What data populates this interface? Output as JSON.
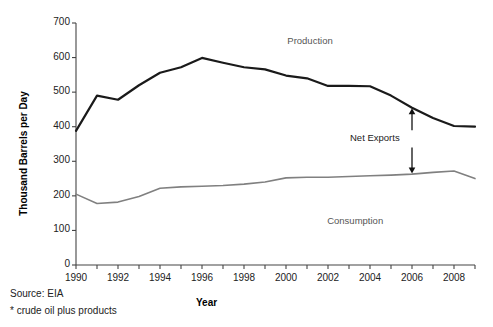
{
  "chart_data": {
    "type": "line",
    "title": "",
    "xlabel": "Year",
    "ylabel": "Thousand Barrels per Day",
    "xlim": [
      1990,
      2009
    ],
    "ylim": [
      0,
      700
    ],
    "ytick_values": [
      0,
      100,
      200,
      300,
      400,
      500,
      600,
      700
    ],
    "ytick_labels": [
      "0",
      "100",
      "200",
      "300",
      "400",
      "500",
      "600",
      "700"
    ],
    "xtick_values": [
      1990,
      1992,
      1994,
      1996,
      1998,
      2000,
      2002,
      2004,
      2006,
      2008
    ],
    "xtick_labels": [
      "1990",
      "1992",
      "1994",
      "1996",
      "1998",
      "2000",
      "2002",
      "2004",
      "2006",
      "2008"
    ],
    "xtick_minor_every": 1,
    "grid": false,
    "legend_position": "inline-annotation",
    "x": [
      1990,
      1991,
      1992,
      1993,
      1994,
      1995,
      1996,
      1997,
      1998,
      1999,
      2000,
      2001,
      2002,
      2003,
      2004,
      2005,
      2006,
      2007,
      2008,
      2009
    ],
    "series": [
      {
        "name": "Production",
        "color": "#1a1a1a",
        "width": 2.2,
        "values": [
          388,
          490,
          478,
          520,
          556,
          572,
          599,
          585,
          572,
          566,
          548,
          540,
          518,
          518,
          517,
          490,
          455,
          425,
          402,
          400
        ]
      },
      {
        "name": "Consumption",
        "color": "#808080",
        "width": 1.6,
        "values": [
          205,
          178,
          182,
          198,
          222,
          226,
          228,
          230,
          234,
          240,
          252,
          254,
          254,
          256,
          258,
          260,
          263,
          268,
          272,
          250
        ]
      }
    ],
    "annotations": [
      {
        "name": "Net Exports",
        "label": "Net Exports",
        "x": 2006,
        "y_top": 455,
        "y_bottom": 263,
        "style": "double-headed-vertical-arrow"
      },
      {
        "name": "Production",
        "label": "Production",
        "x": 2001.3,
        "y": 645
      },
      {
        "name": "Consumption",
        "label": "Consumption",
        "x": 2003.2,
        "y": 125
      }
    ]
  },
  "footnotes": {
    "source": "Source: EIA",
    "note": "* crude oil plus products"
  },
  "colors": {
    "production": "#1a1a1a",
    "consumption": "#808080",
    "axis": "#444444",
    "text": "#222222"
  }
}
